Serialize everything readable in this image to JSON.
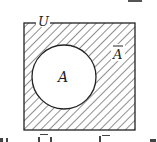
{
  "diagram": {
    "type": "venn",
    "universe_label": "U",
    "set_label": "A",
    "complement_label": "Ā",
    "complement_bar": "‾",
    "shaded_region": "complement",
    "colors": {
      "stroke": "#222222",
      "hatch": "#333333",
      "background": "#ffffff"
    }
  },
  "cropped_text": {
    "top": "",
    "bottom": ""
  }
}
